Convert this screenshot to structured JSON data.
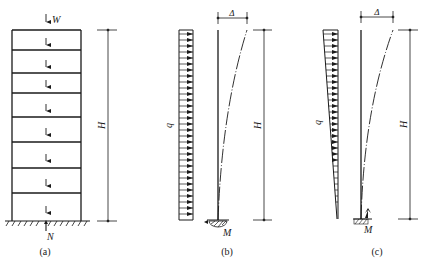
{
  "figure": {
    "stroke_color": "#1a1a1a",
    "background": "#ffffff",
    "panels": [
      {
        "id": "a",
        "caption": "(a)",
        "labels": {
          "top_load": "W",
          "base_reaction": "N",
          "height": "H"
        },
        "stories": 8
      },
      {
        "id": "b",
        "caption": "(b)",
        "labels": {
          "load": "q",
          "displacement": "Δ",
          "height": "H",
          "moment": "M"
        },
        "load_distribution": "uniform"
      },
      {
        "id": "c",
        "caption": "(c)",
        "labels": {
          "load": "q",
          "displacement": "Δ",
          "height": "H",
          "moment": "M"
        },
        "load_distribution": "inverted-triangular"
      }
    ]
  }
}
